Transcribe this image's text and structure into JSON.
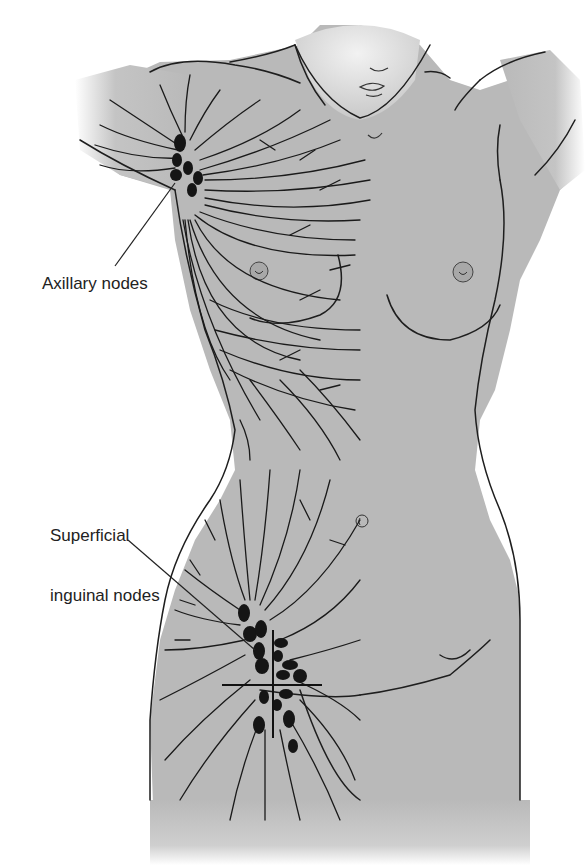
{
  "figure": {
    "colors": {
      "skin": "#b9b9b9",
      "outline": "#1e1e1e",
      "node": "#151515",
      "label_text": "#222222",
      "background": "#ffffff"
    }
  },
  "labels": {
    "axillary": "Axillary nodes",
    "inguinal_line1": "Superficial",
    "inguinal_line2": "inguinal nodes"
  }
}
